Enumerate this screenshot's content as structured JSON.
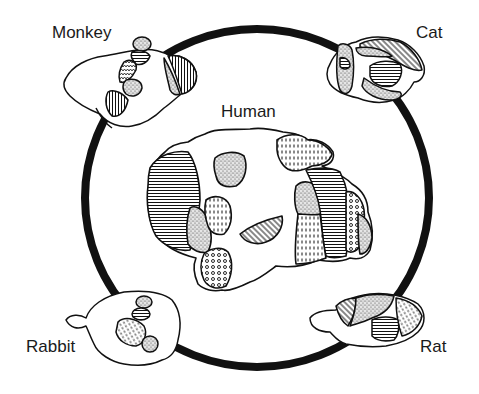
{
  "figure": {
    "colors": {
      "ink": "#111111",
      "background": "#ffffff",
      "ring": "#111111"
    }
  },
  "labels": {
    "human": "Human",
    "monkey": "Monkey",
    "cat": "Cat",
    "rabbit": "Rabbit",
    "rat": "Rat"
  },
  "brains": [
    {
      "species": "Human",
      "position": "center",
      "fills": [
        "horizontal-lines",
        "stipple",
        "vertical-dashes",
        "circles",
        "diagonal-lines",
        "blank"
      ]
    },
    {
      "species": "Monkey",
      "position": "top-left",
      "fills": [
        "stipple",
        "horizontal-lines",
        "vertical-lines",
        "zigzag"
      ]
    },
    {
      "species": "Cat",
      "position": "top-right",
      "fills": [
        "stipple",
        "diagonal-lines",
        "horizontal-lines"
      ]
    },
    {
      "species": "Rabbit",
      "position": "bottom-left",
      "fills": [
        "stipple",
        "horizontal-lines",
        "dashes"
      ]
    },
    {
      "species": "Rat",
      "position": "bottom-right",
      "fills": [
        "diagonal-lines",
        "stipple",
        "horizontal-lines",
        "dashes"
      ]
    }
  ],
  "ring": {
    "shape": "ellipse",
    "connects": [
      "Monkey",
      "Cat",
      "Rat",
      "Rabbit"
    ]
  }
}
